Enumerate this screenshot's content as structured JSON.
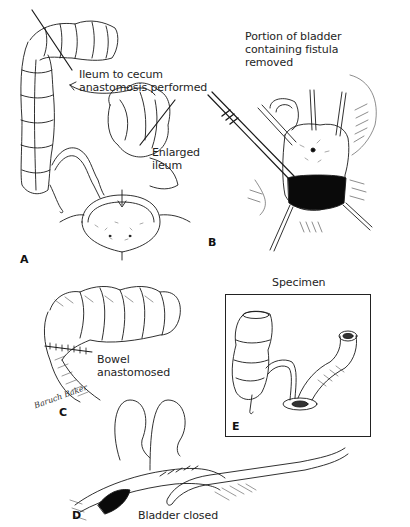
{
  "figure": {
    "type": "surgical-illustration",
    "panels": [
      {
        "id": "A",
        "letter": "A",
        "labels": {
          "anastomosis": [
            "Ileum to cecum",
            "anastomosis performed"
          ],
          "ileum": [
            "Enlarged",
            "ileum"
          ]
        }
      },
      {
        "id": "B",
        "letter": "B",
        "labels": {
          "removed": [
            "Portion of bladder",
            "containing fistula",
            "removed"
          ]
        }
      },
      {
        "id": "C",
        "letter": "C",
        "labels": {
          "bowel": [
            "Bowel",
            "anastomosed"
          ]
        },
        "signature": "Baruch Baker"
      },
      {
        "id": "D",
        "letter": "D",
        "labels": {
          "closed": [
            "Bladder closed"
          ]
        }
      },
      {
        "id": "E",
        "letter": "E",
        "title": "Specimen"
      }
    ],
    "colors": {
      "ink": "#1a1a1a",
      "background": "#ffffff",
      "fill_dark": "#0a0a0a"
    }
  }
}
